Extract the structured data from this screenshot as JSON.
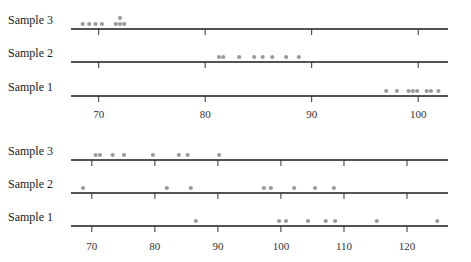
{
  "chart_data": [
    {
      "type": "scatter",
      "subtype": "dot-plot",
      "title": "",
      "xlabel": "",
      "ylabel": "",
      "xlim": [
        67.4,
        102.8
      ],
      "xticks": [
        70,
        80,
        90,
        100
      ],
      "grid": false,
      "legend": "none",
      "dot_color": "#9a9a9a",
      "series": [
        {
          "name": "Sample 3",
          "values": [
            68.5,
            69.1,
            69.7,
            70.3,
            71.6,
            72.0,
            72.0,
            72.4
          ]
        },
        {
          "name": "Sample 2",
          "values": [
            81.3,
            81.7,
            83.2,
            84.6,
            85.4,
            86.3,
            87.6,
            88.8
          ]
        },
        {
          "name": "Sample 1",
          "values": [
            97.0,
            98.0,
            99.1,
            99.5,
            99.9,
            100.8,
            101.2,
            101.9
          ]
        }
      ]
    },
    {
      "type": "scatter",
      "subtype": "dot-plot",
      "title": "",
      "xlabel": "",
      "ylabel": "",
      "xlim": [
        66.7,
        126.5
      ],
      "xticks": [
        70,
        80,
        90,
        100,
        110,
        120
      ],
      "grid": false,
      "legend": "none",
      "dot_color": "#9a9a9a",
      "series": [
        {
          "name": "Sample 3",
          "values": [
            70.6,
            71.3,
            73.3,
            75.1,
            79.7,
            83.8,
            85.2,
            90.2
          ]
        },
        {
          "name": "Sample 2",
          "values": [
            68.6,
            81.9,
            85.7,
            97.3,
            98.4,
            102.1,
            105.4,
            108.4
          ]
        },
        {
          "name": "Sample 1",
          "values": [
            86.5,
            99.7,
            100.8,
            104.3,
            107.1,
            108.6,
            115.2,
            124.8
          ]
        }
      ]
    }
  ]
}
